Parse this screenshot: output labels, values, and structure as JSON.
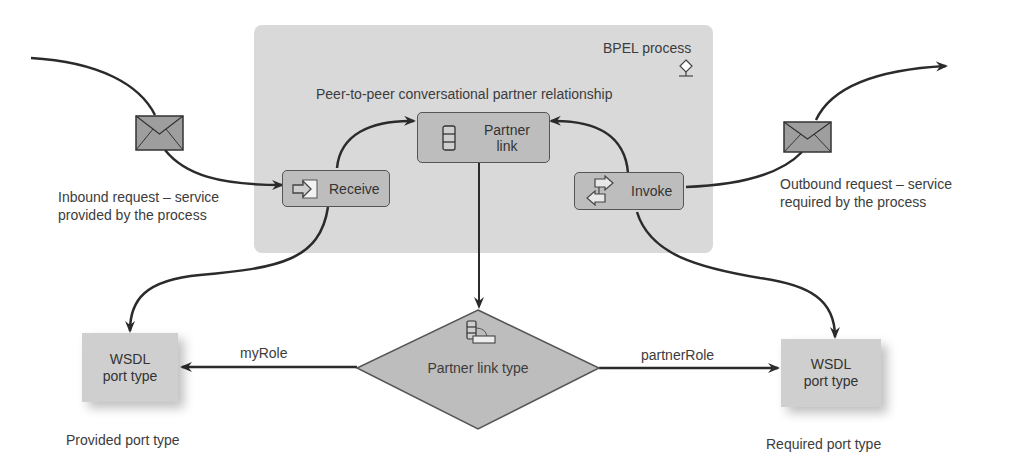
{
  "process": {
    "title": "BPEL process",
    "icon": "bpel-process-icon",
    "relationship_label": "Peer-to-peer conversational partner relationship"
  },
  "nodes": {
    "receive": {
      "label": "Receive",
      "icon": "receive-arrow-icon"
    },
    "partner_link": {
      "label_line1": "Partner",
      "label_line2": "link",
      "icon": "partner-link-stack-icon"
    },
    "invoke": {
      "label": "Invoke",
      "icon": "invoke-bidirectional-arrows-icon"
    },
    "partner_link_type": {
      "label": "Partner link type",
      "icon": "partner-link-type-icon"
    },
    "wsdl_left": {
      "label_line1": "WSDL",
      "label_line2": "port type"
    },
    "wsdl_right": {
      "label_line1": "WSDL",
      "label_line2": "port type"
    }
  },
  "annotations": {
    "inbound_line1": "Inbound request – service",
    "inbound_line2": "provided by the process",
    "outbound_line1": "Outbound request – service",
    "outbound_line2": "required by the process",
    "my_role": "myRole",
    "partner_role": "partnerRole",
    "provided_port_type": "Provided port type",
    "required_port_type": "Required port type"
  },
  "messages": [
    {
      "name": "inbound-message",
      "icon": "envelope-icon"
    },
    {
      "name": "outbound-message",
      "icon": "envelope-icon"
    }
  ],
  "colors": {
    "process_bg": "#d9d9d9",
    "node_fill": "#bdbdbd",
    "node_border": "#555555",
    "wsdl_fill": "#cfcfcf",
    "line": "#2b2b2b",
    "text": "#3c3c3c"
  }
}
